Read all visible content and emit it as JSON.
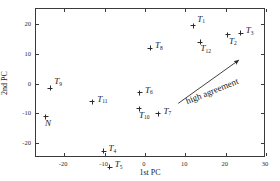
{
  "chart_data": {
    "type": "scatter",
    "title": "",
    "xlabel": "1st PC",
    "ylabel": "2nd PC",
    "xlim": [
      -27,
      30
    ],
    "ylim": [
      -25,
      25
    ],
    "xticks": [
      -20,
      -10,
      0,
      10,
      20,
      30
    ],
    "xticklabels": [
      "-20",
      "-10",
      "0",
      "10",
      "20",
      "30"
    ],
    "yticks": [
      20,
      10,
      0,
      -10,
      -20
    ],
    "yticklabels": [
      "20",
      "10",
      "0",
      "-10",
      "-20"
    ],
    "grid": false,
    "legend": null,
    "marker": "plus",
    "points": [
      {
        "label": "T",
        "sub": "1",
        "x": 12.2,
        "y": 19.1,
        "label_dx": 4,
        "label_dy": -5
      },
      {
        "label": "T",
        "sub": "2",
        "x": 20.8,
        "y": 16.0,
        "label_dx": 1,
        "label_dy": 8
      },
      {
        "label": "T",
        "sub": "3",
        "x": 24.0,
        "y": 16.5,
        "label_dx": 5,
        "label_dy": -1
      },
      {
        "label": "T",
        "sub": "4",
        "x": -10.0,
        "y": -23.0,
        "label_dx": 5,
        "label_dy": -1
      },
      {
        "label": "T",
        "sub": "5",
        "x": -8.5,
        "y": -28.5,
        "label_dx": 5,
        "label_dy": -1
      },
      {
        "label": "T",
        "sub": "6",
        "x": -1.0,
        "y": -3.5,
        "label_dx": 5,
        "label_dy": -1
      },
      {
        "label": "T",
        "sub": "7",
        "x": 3.6,
        "y": -10.5,
        "label_dx": 5,
        "label_dy": -1
      },
      {
        "label": "T",
        "sub": "8",
        "x": 1.5,
        "y": 11.5,
        "label_dx": 5,
        "label_dy": -1
      },
      {
        "label": "T",
        "sub": "9",
        "x": -23.2,
        "y": -2.0,
        "label_dx": 4,
        "label_dy": -5
      },
      {
        "label": "T",
        "sub": "10",
        "x": -1.2,
        "y": -8.8,
        "label_dx": 0,
        "label_dy": 8
      },
      {
        "label": "T",
        "sub": "11",
        "x": -12.8,
        "y": -6.5,
        "label_dx": 5,
        "label_dy": -1
      },
      {
        "label": "T",
        "sub": "12",
        "x": 14.0,
        "y": 13.5,
        "label_dx": 0,
        "label_dy": 8
      },
      {
        "label": "N",
        "sub": "",
        "x": -24.3,
        "y": -11.5,
        "label_dx": -1,
        "label_dy": 8
      }
    ],
    "annotations": [
      {
        "text": "high agreement",
        "type": "arrow",
        "x_start": 8.5,
        "y_start": -7.0,
        "x_end": 23.5,
        "y_end": 7.5,
        "rotation_deg": -22
      }
    ]
  }
}
